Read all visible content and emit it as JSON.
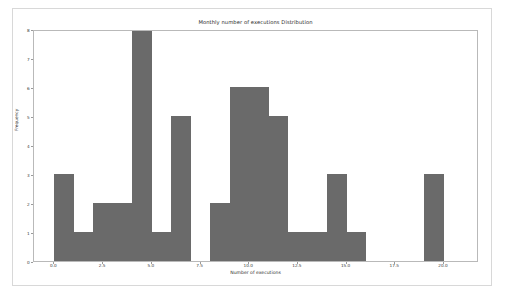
{
  "figure": {
    "background_color": "#ffffff",
    "border_color": "#d8d8d8"
  },
  "chart_data": {
    "type": "bar",
    "subtype": "histogram",
    "title": "Monthly number of executions Distribution",
    "xlabel": "Number of executions",
    "ylabel": "Frequency",
    "bar_color": "#6a6a6a",
    "grid": false,
    "legend": null,
    "xlim": [
      -1.05,
      21.8
    ],
    "ylim": [
      0,
      8
    ],
    "bin_width": 1.0,
    "xticks": [
      0.0,
      2.5,
      5.0,
      7.5,
      10.0,
      12.5,
      15.0,
      17.5,
      20.0
    ],
    "xtick_labels": [
      "0.0",
      "2.5",
      "5.0",
      "7.5",
      "10.0",
      "12.5",
      "15.0",
      "17.5",
      "20.0"
    ],
    "yticks": [
      0,
      1,
      2,
      3,
      4,
      5,
      6,
      7,
      8
    ],
    "ytick_labels": [
      "0",
      "1",
      "2",
      "3",
      "4",
      "5",
      "6",
      "7",
      "8"
    ],
    "bins": [
      {
        "left": 0.0,
        "right": 1.0,
        "value": 3
      },
      {
        "left": 1.0,
        "right": 2.0,
        "value": 1
      },
      {
        "left": 2.0,
        "right": 3.0,
        "value": 2
      },
      {
        "left": 3.0,
        "right": 4.0,
        "value": 2
      },
      {
        "left": 4.0,
        "right": 5.0,
        "value": 8
      },
      {
        "left": 5.0,
        "right": 6.0,
        "value": 1
      },
      {
        "left": 6.0,
        "right": 7.0,
        "value": 5
      },
      {
        "left": 7.0,
        "right": 8.0,
        "value": 0
      },
      {
        "left": 8.0,
        "right": 9.0,
        "value": 2
      },
      {
        "left": 9.0,
        "right": 10.0,
        "value": 6
      },
      {
        "left": 10.0,
        "right": 11.0,
        "value": 6
      },
      {
        "left": 11.0,
        "right": 12.0,
        "value": 5
      },
      {
        "left": 12.0,
        "right": 13.0,
        "value": 1
      },
      {
        "left": 13.0,
        "right": 14.0,
        "value": 1
      },
      {
        "left": 14.0,
        "right": 15.0,
        "value": 3
      },
      {
        "left": 15.0,
        "right": 16.0,
        "value": 1
      },
      {
        "left": 16.0,
        "right": 17.0,
        "value": 0
      },
      {
        "left": 17.0,
        "right": 18.0,
        "value": 0
      },
      {
        "left": 18.0,
        "right": 19.0,
        "value": 0
      },
      {
        "left": 19.0,
        "right": 20.0,
        "value": 3
      },
      {
        "left": 20.0,
        "right": 21.0,
        "value": 0
      }
    ],
    "categories": [
      "0-1",
      "1-2",
      "2-3",
      "3-4",
      "4-5",
      "5-6",
      "6-7",
      "7-8",
      "8-9",
      "9-10",
      "10-11",
      "11-12",
      "12-13",
      "13-14",
      "14-15",
      "15-16",
      "16-17",
      "17-18",
      "18-19",
      "19-20",
      "20-21"
    ],
    "values": [
      3,
      1,
      2,
      2,
      8,
      1,
      5,
      0,
      2,
      6,
      6,
      5,
      1,
      1,
      3,
      1,
      0,
      0,
      0,
      3,
      0
    ]
  }
}
